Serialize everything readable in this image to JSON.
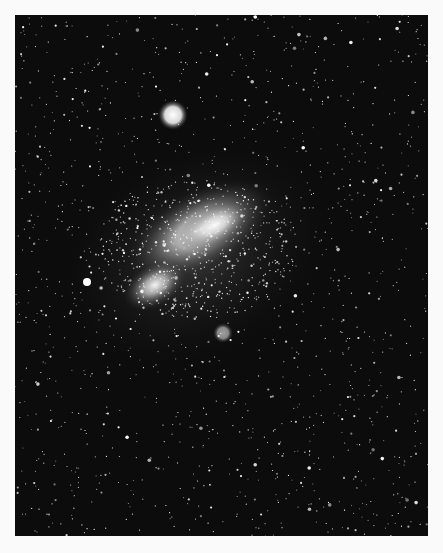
{
  "image": {
    "subject": "dwarf galaxy star field",
    "description": "Black-and-white astronomical photograph of an irregular galaxy with a bright globular cluster to the upper left, dense star field background",
    "colors": {
      "page_background": "#fafafa",
      "sky": "#0c0c0c",
      "stars": "#ffffff"
    },
    "features": [
      {
        "name": "galaxy-main-body",
        "cx": 200,
        "cy": 215,
        "rx": 75,
        "ry": 38,
        "rotate": -28
      },
      {
        "name": "galaxy-wing",
        "cx": 150,
        "cy": 275,
        "rx": 35,
        "ry": 22,
        "rotate": -30
      },
      {
        "name": "globular-cluster",
        "cx": 160,
        "cy": 100,
        "r": 12
      },
      {
        "name": "bright-star-left",
        "cx": 72,
        "cy": 267,
        "r": 4
      },
      {
        "name": "knot-lower",
        "cx": 207,
        "cy": 318,
        "r": 8
      }
    ]
  }
}
